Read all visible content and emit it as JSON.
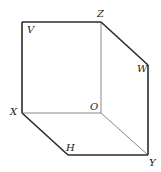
{
  "diagram": {
    "type": "cube-like solid (parallelepiped) outline",
    "labels": {
      "V": "V",
      "Z": "Z",
      "W": "W",
      "X": "X",
      "O": "O",
      "H": "H",
      "Y": "Y"
    },
    "colors": {
      "stroke": "#2a2a2a",
      "thin_stroke": "#6a6a6a",
      "background": "#ffffff"
    }
  }
}
